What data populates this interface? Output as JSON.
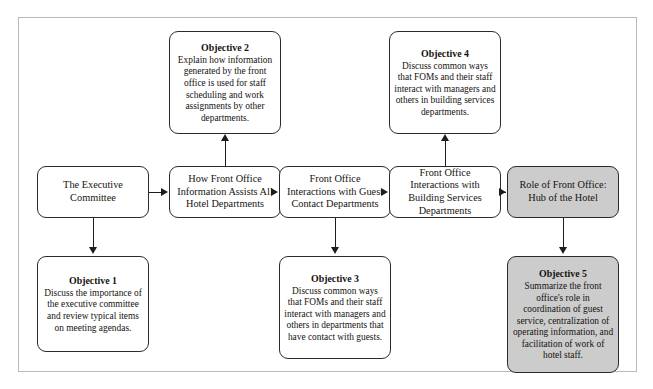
{
  "diagram": {
    "flow_boxes": [
      {
        "id": "executive-committee",
        "label": "The Executive Committee",
        "shaded": false
      },
      {
        "id": "front-office-information",
        "label": "How Front Office Information Assists All Hotel Departments",
        "shaded": false
      },
      {
        "id": "guest-contact-departments",
        "label": "Front Office Interactions with Guest Contact Departments",
        "shaded": false
      },
      {
        "id": "building-services-departments",
        "label": "Front Office Interactions with Building Services Departments",
        "shaded": false
      },
      {
        "id": "role-of-front-office",
        "label": "Role of Front Office: Hub of the Hotel",
        "shaded": true
      }
    ],
    "objective_boxes": [
      {
        "id": "objective-1",
        "title": "Objective 1",
        "body": "Discuss the importance of the executive committee and review typical items on meeting agendas.",
        "shaded": false
      },
      {
        "id": "objective-2",
        "title": "Objective 2",
        "body": "Explain how information generated by the front office is used for staff scheduling and work assignments by other departments.",
        "shaded": false
      },
      {
        "id": "objective-3",
        "title": "Objective 3",
        "body": "Discuss common ways that FOMs and their staff interact with managers and others in departments that have contact with guests.",
        "shaded": false
      },
      {
        "id": "objective-4",
        "title": "Objective 4",
        "body": "Discuss common ways that FOMs and their staff interact with managers and others in building services departments.",
        "shaded": false
      },
      {
        "id": "objective-5",
        "title": "Objective 5",
        "body": "Summarize the front office's role in coordination of guest service, centralization of operating information, and facilitation of work of hotel staff.",
        "shaded": true
      }
    ],
    "colors": {
      "shaded_fill": "#cccccc",
      "box_border": "#2b2b2b",
      "connector": "#1d1d1d",
      "frame_border": "#b9b9b9",
      "text": "#16130f"
    }
  }
}
